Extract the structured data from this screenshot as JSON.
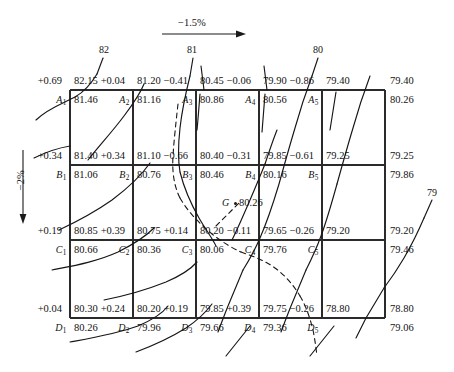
{
  "figure": {
    "slope_horizontal": "−1.5%",
    "slope_vertical": "−2%",
    "point_label": "G",
    "point_value": "80.26"
  },
  "contour_labels": [
    {
      "text": "82"
    },
    {
      "text": "81"
    },
    {
      "text": "80"
    },
    {
      "text": "79"
    }
  ],
  "rows": [
    {
      "row": "A",
      "nodes": [
        {
          "name": "A",
          "sub": "1",
          "delta": "+0.69",
          "design": "82.15",
          "ground": "81.46"
        },
        {
          "name": "A",
          "sub": "2",
          "delta": "+0.04",
          "design": "81.20",
          "ground": "81.16"
        },
        {
          "name": "A",
          "sub": "3",
          "delta": "−0.41",
          "design": "80.45",
          "ground": "80.86"
        },
        {
          "name": "A",
          "sub": "4",
          "delta": "−0.06",
          "design": "79.90",
          "ground": "80.56"
        },
        {
          "name": "A",
          "sub": "5",
          "delta": "−0.86",
          "design": "79.40",
          "ground": "80.26"
        }
      ]
    },
    {
      "row": "B",
      "nodes": [
        {
          "name": "B",
          "sub": "1",
          "delta": "+0.34",
          "design": "81.40",
          "ground": "81.06"
        },
        {
          "name": "B",
          "sub": "2",
          "delta": "+0.34",
          "design": "81.10",
          "ground": "80.76"
        },
        {
          "name": "B",
          "sub": "3",
          "delta": "−0.66",
          "design": "80.40",
          "ground": "80.46"
        },
        {
          "name": "B",
          "sub": "4",
          "delta": "−0.31",
          "design": "79.85",
          "ground": "80.16"
        },
        {
          "name": "B",
          "sub": "5",
          "delta": "−0.61",
          "design": "79.25",
          "ground": "79.86"
        }
      ]
    },
    {
      "row": "C",
      "nodes": [
        {
          "name": "C",
          "sub": "1",
          "delta": "+0.19",
          "design": "80.85",
          "ground": "80.66"
        },
        {
          "name": "C",
          "sub": "2",
          "delta": "+0.39",
          "design": "80.75",
          "ground": "80.36"
        },
        {
          "name": "C",
          "sub": "3",
          "delta": "+0.14",
          "design": "80.20",
          "ground": "80.06"
        },
        {
          "name": "C",
          "sub": "4",
          "delta": "−0.11",
          "design": "79.65",
          "ground": "79.76"
        },
        {
          "name": "C",
          "sub": "5",
          "delta": "−0.26",
          "design": "79.20",
          "ground": "79.46"
        }
      ]
    },
    {
      "row": "D",
      "nodes": [
        {
          "name": "D",
          "sub": "1",
          "delta": "+0.04",
          "design": "80.30",
          "ground": "80.26"
        },
        {
          "name": "D",
          "sub": "2",
          "delta": "+0.24",
          "design": "80.20",
          "ground": "79.96"
        },
        {
          "name": "D",
          "sub": "3",
          "delta": "+0.19",
          "design": "79.85",
          "ground": "79.66"
        },
        {
          "name": "D",
          "sub": "4",
          "delta": "+0.39",
          "design": "79.75",
          "ground": "79.36"
        },
        {
          "name": "D",
          "sub": "5",
          "delta": "−0.26",
          "design": "78.80",
          "ground": "79.06"
        }
      ]
    }
  ],
  "colors": {
    "ink": "#1a1a1a",
    "grid": "#2b2b2b",
    "contour": "#161616"
  }
}
